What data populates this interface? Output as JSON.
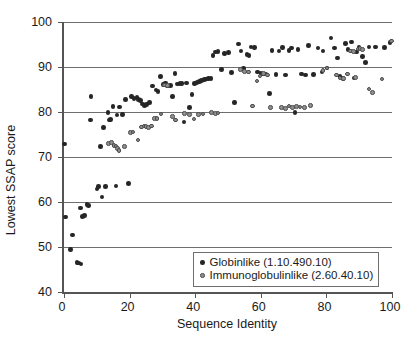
{
  "chart_data": {
    "type": "scatter",
    "title": "",
    "xlabel": "Sequence Identity",
    "ylabel": "Lowest SSAP score",
    "xlim": [
      0,
      100
    ],
    "ylim": [
      40,
      100
    ],
    "xticks": [
      0,
      20,
      40,
      60,
      80,
      100
    ],
    "yticks": [
      40,
      50,
      60,
      70,
      80,
      90,
      100
    ],
    "grid": "horizontal",
    "legend_position": "bottom-right",
    "series": [
      {
        "name": "Globinlike (1.10.490.10)",
        "color": "#262626",
        "marker": "filled-circle",
        "points": [
          [
            0.2,
            72.9
          ],
          [
            0.4,
            56.7
          ],
          [
            2.0,
            49.4
          ],
          [
            2.6,
            52.7
          ],
          [
            4.0,
            46.5
          ],
          [
            4.4,
            46.4
          ],
          [
            5.2,
            46.2
          ],
          [
            5.0,
            58.7
          ],
          [
            5.6,
            56.8
          ],
          [
            6.2,
            57.0
          ],
          [
            7.0,
            59.4
          ],
          [
            7.4,
            59.2
          ],
          [
            8.2,
            83.4
          ],
          [
            8.0,
            78.2
          ],
          [
            10.0,
            62.9
          ],
          [
            10.6,
            63.4
          ],
          [
            11.2,
            72.3
          ],
          [
            11.6,
            61.1
          ],
          [
            12.0,
            76.5
          ],
          [
            12.6,
            63.5
          ],
          [
            13.4,
            79.9
          ],
          [
            13.8,
            78.2
          ],
          [
            14.2,
            78.3
          ],
          [
            15.0,
            81.2
          ],
          [
            15.8,
            63.6
          ],
          [
            16.2,
            79.3
          ],
          [
            17.0,
            81.1
          ],
          [
            17.8,
            79.4
          ],
          [
            18.8,
            82.8
          ],
          [
            19.6,
            64.1
          ],
          [
            20.6,
            83.4
          ],
          [
            21.4,
            83.0
          ],
          [
            22.2,
            83.2
          ],
          [
            22.8,
            82.8
          ],
          [
            23.4,
            82.6
          ],
          [
            24.0,
            81.8
          ],
          [
            24.6,
            81.4
          ],
          [
            25.2,
            81.7
          ],
          [
            26.0,
            82.1
          ],
          [
            27.0,
            85.8
          ],
          [
            28.0,
            84.9
          ],
          [
            28.6,
            84.5
          ],
          [
            29.4,
            87.9
          ],
          [
            30.4,
            86.1
          ],
          [
            31.0,
            86.4
          ],
          [
            31.6,
            85.8
          ],
          [
            32.4,
            85.9
          ],
          [
            33.0,
            83.5
          ],
          [
            33.8,
            88.5
          ],
          [
            34.6,
            86.2
          ],
          [
            35.4,
            86.3
          ],
          [
            36.0,
            86.3
          ],
          [
            36.6,
            77.8
          ],
          [
            37.4,
            86.4
          ],
          [
            38.2,
            81.0
          ],
          [
            39.0,
            83.9
          ],
          [
            39.8,
            86.3
          ],
          [
            40.6,
            86.5
          ],
          [
            41.4,
            86.8
          ],
          [
            42.0,
            87.0
          ],
          [
            42.8,
            87.2
          ],
          [
            43.4,
            87.3
          ],
          [
            44.0,
            87.4
          ],
          [
            44.8,
            87.5
          ],
          [
            45.4,
            92.6
          ],
          [
            46.2,
            93.3
          ],
          [
            47.0,
            93.4
          ],
          [
            48.0,
            89.4
          ],
          [
            49.0,
            93.0
          ],
          [
            50.2,
            93.2
          ],
          [
            51.0,
            88.8
          ],
          [
            52.0,
            82.1
          ],
          [
            53.2,
            95.1
          ],
          [
            54.0,
            93.6
          ],
          [
            54.8,
            89.7
          ],
          [
            55.8,
            92.8
          ],
          [
            56.4,
            92.6
          ],
          [
            57.0,
            94.4
          ],
          [
            58.0,
            94.3
          ],
          [
            59.0,
            88.9
          ],
          [
            60.0,
            88.6
          ],
          [
            60.8,
            88.4
          ],
          [
            61.6,
            88.4
          ],
          [
            62.6,
            84.1
          ],
          [
            63.4,
            93.7
          ],
          [
            64.6,
            88.3
          ],
          [
            65.6,
            93.6
          ],
          [
            66.6,
            94.3
          ],
          [
            67.6,
            88.2
          ],
          [
            68.6,
            93.7
          ],
          [
            69.4,
            94.2
          ],
          [
            70.4,
            79.9
          ],
          [
            71.4,
            93.9
          ],
          [
            72.4,
            88.4
          ],
          [
            73.6,
            88.2
          ],
          [
            74.6,
            94.8
          ],
          [
            76.0,
            88.3
          ],
          [
            77.4,
            94.2
          ],
          [
            78.6,
            88.9
          ],
          [
            79.0,
            93.6
          ],
          [
            80.2,
            89.8
          ],
          [
            81.4,
            96.4
          ],
          [
            82.4,
            94.2
          ],
          [
            83.4,
            92.0
          ],
          [
            84.2,
            87.9
          ],
          [
            85.0,
            87.5
          ],
          [
            85.8,
            95.2
          ],
          [
            86.6,
            93.9
          ],
          [
            87.6,
            95.6
          ],
          [
            88.4,
            87.6
          ],
          [
            89.2,
            93.3
          ],
          [
            90.0,
            94.3
          ],
          [
            91.0,
            92.3
          ],
          [
            92.0,
            91.0
          ],
          [
            93.0,
            94.4
          ],
          [
            95.0,
            94.4
          ],
          [
            97.8,
            94.3
          ],
          [
            99.4,
            95.5
          ]
        ]
      },
      {
        "name": "Immunoglobulinlike (2.60.40.10)",
        "color": "#8f8f8f",
        "marker": "open-circle",
        "points": [
          [
            13.6,
            73.0
          ],
          [
            14.4,
            73.2
          ],
          [
            15.2,
            72.6
          ],
          [
            15.8,
            72.4
          ],
          [
            16.4,
            71.9
          ],
          [
            16.8,
            71.4
          ],
          [
            18.4,
            72.3
          ],
          [
            20.2,
            75.4
          ],
          [
            21.0,
            75.6
          ],
          [
            22.6,
            73.8
          ],
          [
            23.6,
            76.7
          ],
          [
            24.4,
            76.9
          ],
          [
            25.0,
            76.8
          ],
          [
            25.8,
            76.6
          ],
          [
            26.6,
            76.9
          ],
          [
            27.6,
            78.5
          ],
          [
            28.4,
            78.6
          ],
          [
            29.6,
            79.6
          ],
          [
            30.6,
            86.0
          ],
          [
            31.6,
            85.9
          ],
          [
            33.0,
            79.0
          ],
          [
            34.0,
            78.2
          ],
          [
            36.8,
            79.7
          ],
          [
            38.2,
            79.4
          ],
          [
            39.6,
            78.4
          ],
          [
            41.0,
            79.5
          ],
          [
            42.4,
            79.6
          ],
          [
            45.0,
            79.9
          ],
          [
            46.2,
            79.7
          ],
          [
            47.0,
            79.8
          ],
          [
            53.8,
            89.4
          ],
          [
            55.0,
            89.0
          ],
          [
            56.2,
            88.9
          ],
          [
            57.4,
            81.3
          ],
          [
            58.8,
            86.9
          ],
          [
            59.8,
            88.0
          ],
          [
            60.8,
            88.6
          ],
          [
            62.0,
            88.2
          ],
          [
            63.0,
            81.0
          ],
          [
            66.4,
            81.0
          ],
          [
            67.6,
            80.8
          ],
          [
            68.6,
            81.3
          ],
          [
            69.6,
            81.0
          ],
          [
            70.8,
            81.2
          ],
          [
            72.0,
            81.1
          ],
          [
            73.4,
            81.0
          ],
          [
            75.2,
            81.4
          ],
          [
            79.0,
            89.2
          ],
          [
            80.2,
            89.8
          ],
          [
            83.0,
            88.2
          ],
          [
            84.2,
            87.6
          ],
          [
            85.2,
            87.4
          ],
          [
            86.4,
            88.4
          ],
          [
            87.4,
            93.6
          ],
          [
            88.2,
            93.4
          ],
          [
            88.8,
            87.7
          ],
          [
            89.6,
            94.0
          ],
          [
            90.2,
            94.1
          ],
          [
            91.0,
            93.9
          ],
          [
            93.0,
            85.1
          ],
          [
            94.0,
            84.3
          ],
          [
            97.0,
            87.3
          ],
          [
            99.8,
            95.8
          ]
        ]
      }
    ]
  }
}
